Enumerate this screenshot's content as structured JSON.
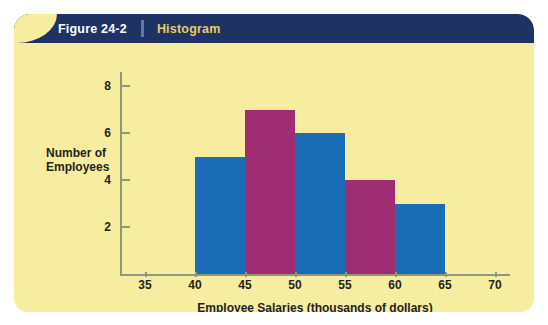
{
  "banner": {
    "figure_number": "Figure 24-2",
    "figure_kind": "Histogram",
    "banner_color": "#1e3264",
    "figure_number_color": "#ffffff",
    "figure_kind_color": "#e9c96c",
    "divider_color": "#5d7aa8"
  },
  "card": {
    "background_color": "#f6eda0"
  },
  "chart_data": {
    "type": "bar",
    "title": "Histogram",
    "xlabel": "Employee Salaries (thousands of dollars)",
    "ylabel": "Number of Employees",
    "ylabel_line1": "Number of",
    "ylabel_line2": "Employees",
    "xlim": [
      32.5,
      71.5
    ],
    "ylim": [
      0,
      8.6
    ],
    "x_ticks": [
      35,
      40,
      45,
      50,
      55,
      60,
      65,
      70
    ],
    "x_tick_labels": [
      "35",
      "40",
      "45",
      "50",
      "55",
      "60",
      "65",
      "70"
    ],
    "y_ticks": [
      2,
      4,
      6,
      8
    ],
    "y_tick_labels": [
      "2",
      "4",
      "6",
      "8"
    ],
    "grid": false,
    "legend": "none",
    "bin_width": 5,
    "bins": [
      {
        "label": "40-45",
        "start": 40,
        "end": 45,
        "value": 5,
        "color": "#1a6cb5"
      },
      {
        "label": "45-50",
        "start": 45,
        "end": 50,
        "value": 7,
        "color": "#9e2d74"
      },
      {
        "label": "50-55",
        "start": 50,
        "end": 55,
        "value": 6,
        "color": "#1a6cb5"
      },
      {
        "label": "55-60",
        "start": 55,
        "end": 60,
        "value": 4,
        "color": "#9e2d74"
      },
      {
        "label": "60-65",
        "start": 60,
        "end": 65,
        "value": 3,
        "color": "#1a6cb5"
      }
    ],
    "categories": [
      "40-45",
      "45-50",
      "50-55",
      "55-60",
      "60-65"
    ],
    "values": [
      5,
      7,
      6,
      4,
      3
    ],
    "colors": [
      "#1a6cb5",
      "#9e2d74",
      "#1a6cb5",
      "#9e2d74",
      "#1a6cb5"
    ],
    "axis_color": "#8c9a7a",
    "text_color": "#231f20"
  }
}
